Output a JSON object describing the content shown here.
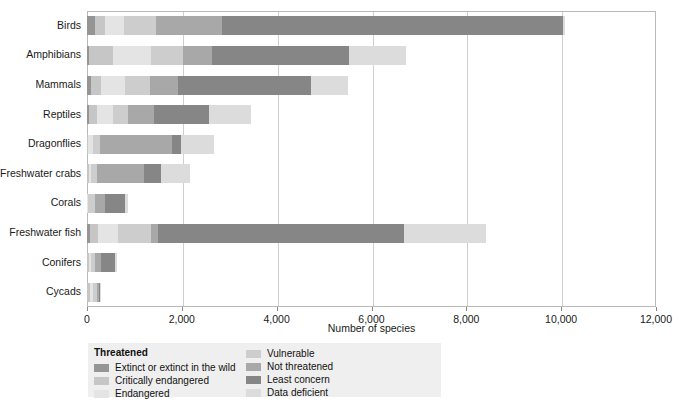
{
  "chart_data": {
    "type": "bar",
    "orientation": "horizontal",
    "stacked": true,
    "title": "",
    "xlabel": "Number of species",
    "ylabel": "",
    "xlim": [
      0,
      12000
    ],
    "xticks": [
      0,
      2000,
      4000,
      6000,
      8000,
      10000,
      12000
    ],
    "xtick_labels": [
      "0",
      "2,000",
      "4,000",
      "6,000",
      "8,000",
      "10,000",
      "12,000"
    ],
    "grid": "vertical",
    "legend_position": "below-left",
    "categories": [
      "Birds",
      "Amphibians",
      "Mammals",
      "Reptiles",
      "Dragonflies",
      "Freshwater crabs",
      "Corals",
      "Freshwater fish",
      "Conifers",
      "Cycads"
    ],
    "series": [
      {
        "name": "Extinct or extinct in the wild",
        "color": "#959595",
        "group": "Threatened",
        "values": [
          160,
          40,
          90,
          35,
          2,
          2,
          0,
          70,
          2,
          5
        ]
      },
      {
        "name": "Critically endangered",
        "color": "#c6c6c6",
        "group": "Threatened",
        "values": [
          220,
          510,
          210,
          180,
          20,
          30,
          6,
          170,
          35,
          60
        ]
      },
      {
        "name": "Endangered",
        "color": "#e4e4e4",
        "group": "Threatened",
        "values": [
          400,
          800,
          500,
          330,
          110,
          60,
          20,
          420,
          50,
          65
        ]
      },
      {
        "name": "Vulnerable",
        "color": "#cdcdcd",
        "group": "",
        "values": [
          680,
          680,
          520,
          310,
          140,
          110,
          150,
          700,
          90,
          80
        ]
      },
      {
        "name": "Not threatened",
        "color": "#a8a8a8",
        "group": "",
        "values": [
          1380,
          600,
          600,
          560,
          1520,
          1000,
          200,
          140,
          120,
          35
        ]
      },
      {
        "name": "Least concern",
        "color": "#868686",
        "group": "",
        "values": [
          7200,
          2900,
          2800,
          1150,
          200,
          350,
          420,
          5180,
          300,
          25
        ]
      },
      {
        "name": "Data deficient",
        "color": "#dcdcdc",
        "group": "",
        "values": [
          40,
          1200,
          780,
          900,
          680,
          620,
          60,
          1730,
          40,
          35
        ]
      }
    ],
    "legend": {
      "title": "Threatened",
      "left_column": [
        {
          "label": "Extinct or extinct in the wild",
          "color": "#959595"
        },
        {
          "label": "Critically endangered",
          "color": "#c6c6c6"
        },
        {
          "label": "Endangered",
          "color": "#e4e4e4"
        }
      ],
      "right_column": [
        {
          "label": "Vulnerable",
          "color": "#cdcdcd"
        },
        {
          "label": "Not threatened",
          "color": "#a8a8a8"
        },
        {
          "label": "Least concern",
          "color": "#868686"
        },
        {
          "label": "Data deficient",
          "color": "#dcdcdc"
        }
      ]
    }
  }
}
